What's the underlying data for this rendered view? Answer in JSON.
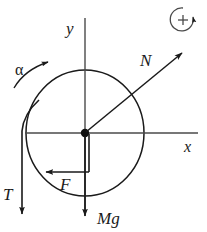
{
  "figure": {
    "background_color": "#ffffff",
    "stroke_color": "#1a1a1a",
    "width": 207,
    "height": 232
  },
  "axes": {
    "y_label": "y",
    "x_label": "x",
    "origin_label": "center-of-mass",
    "x_axis": {
      "x1": 25,
      "y1": 133,
      "x2": 198,
      "y2": 133
    },
    "y_axis": {
      "x1": 85,
      "y1": 18,
      "x2": 85,
      "y2": 210
    }
  },
  "body": {
    "shape": "circle",
    "name": "wheel",
    "center_x": 85,
    "center_y": 133,
    "radius": 58
  },
  "rotation_indicator": {
    "sign_label": "+",
    "direction": "counterclockwise",
    "center_x": 182,
    "center_y": 19,
    "radius": 12
  },
  "angular_acceleration": {
    "label": "α",
    "direction": "counterclockwise"
  },
  "forces": [
    {
      "label": "N",
      "name": "normal-force",
      "direction": "up-right",
      "angle_deg": 40,
      "from_x": 85,
      "from_y": 133,
      "to_x": 185,
      "to_y": 50
    },
    {
      "label": "Mg",
      "name": "weight-force",
      "direction": "down",
      "angle_deg": 270,
      "from_x": 85,
      "from_y": 133,
      "to_x": 85,
      "to_y": 222
    },
    {
      "label": "F",
      "name": "applied-force",
      "direction": "left",
      "angle_deg": 180,
      "from_x": 89,
      "from_y": 172,
      "to_x": 43,
      "to_y": 172
    },
    {
      "label": "T",
      "name": "tension-force",
      "direction": "down",
      "angle_deg": 270,
      "from_x": 22,
      "from_y": 112,
      "to_x": 22,
      "to_y": 222
    }
  ]
}
